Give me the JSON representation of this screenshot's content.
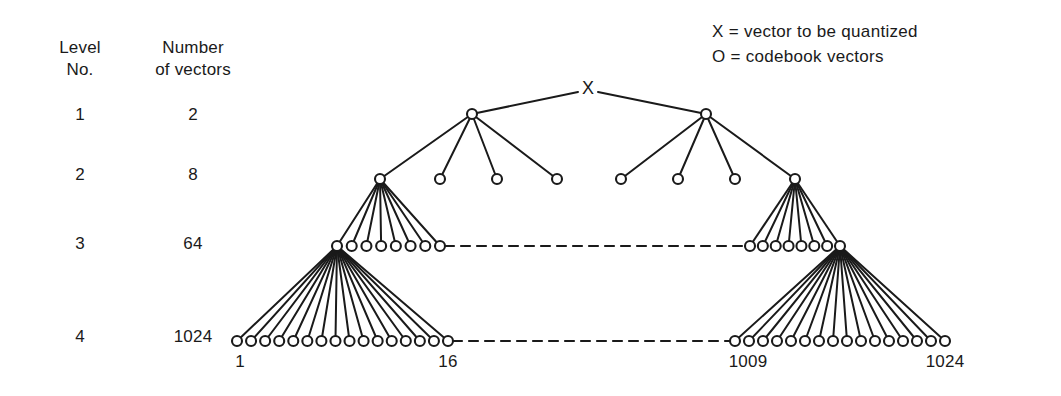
{
  "figure": {
    "background_color": "#ffffff",
    "ink_color": "#1a1a1a"
  },
  "table": {
    "header": {
      "col1_line1": "Level",
      "col1_line2": "No.",
      "col2_line1": "Number",
      "col2_line2": "of vectors"
    },
    "rows": [
      {
        "level": "1",
        "vectors": "2"
      },
      {
        "level": "2",
        "vectors": "8"
      },
      {
        "level": "3",
        "vectors": "64"
      },
      {
        "level": "4",
        "vectors": "1024"
      }
    ]
  },
  "legend": {
    "items": [
      {
        "symbol": "X",
        "equals": "=",
        "text": "vector to be quantized",
        "full": "X  =  vector to be quantized"
      },
      {
        "symbol": "O",
        "equals": "=",
        "text": "codebook vectors",
        "full": "O  =  codebook vectors"
      }
    ]
  },
  "axis_labels": {
    "left_start": "1",
    "left_end": "16",
    "right_start": "1009",
    "right_end": "1024"
  },
  "root_marker": {
    "label": "X"
  },
  "chart_data": {
    "type": "diagram",
    "subtype": "tree",
    "levels": [
      {
        "level": 1,
        "vectors": 2,
        "branching_from_root": 2,
        "drawn_nodes": 2
      },
      {
        "level": 2,
        "vectors": 8,
        "branching": 4,
        "drawn_nodes": 8
      },
      {
        "level": 3,
        "vectors": 64,
        "branching": 8,
        "drawn_nodes": 16
      },
      {
        "level": 4,
        "vectors": 1024,
        "branching": 16,
        "drawn_nodes": 32
      }
    ],
    "leaf_index_range": [
      1,
      1024
    ],
    "left_leaf_labels": [
      "1",
      "16"
    ],
    "right_leaf_labels": [
      "1009",
      "1024"
    ],
    "elided_connections": "dashed lines at levels 3 and 4 indicate omitted intermediate subtrees"
  }
}
